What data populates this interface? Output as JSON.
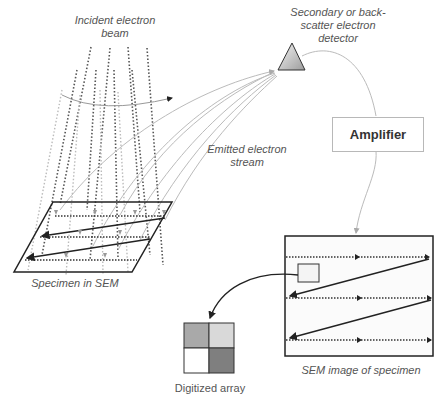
{
  "labels": {
    "incident_beam": "Incident electron beam",
    "detector": "Secondary or back-scatter electron detector",
    "amplifier": "Amplifier",
    "emitted_stream": "Emitted electron stream",
    "specimen": "Specimen in SEM",
    "sem_image": "SEM image of specimen",
    "digitized_array": "Digitized array"
  },
  "colors": {
    "detector_fill_light": "#f2f2f2",
    "detector_fill_dark": "#a0a0a0",
    "line_dark": "#222222",
    "line_light": "#bbbbbb",
    "grid_cells": [
      "#a9a9a9",
      "#d9d9d9",
      "#ffffff",
      "#7f7f7f"
    ]
  }
}
